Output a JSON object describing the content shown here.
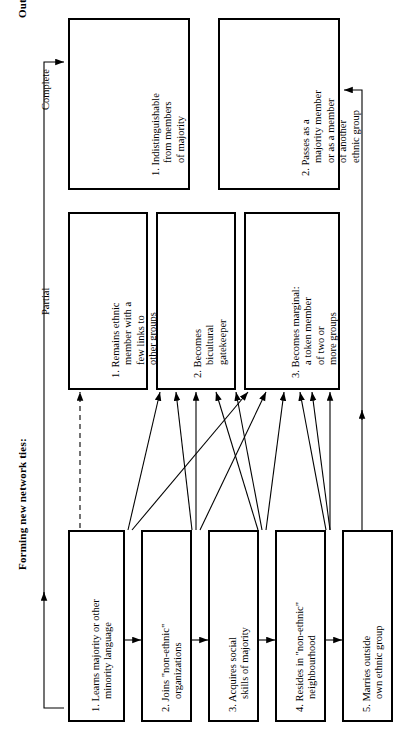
{
  "titles": {
    "outcome": "Outcome: Assimilation",
    "network": "Forming new network ties:"
  },
  "column_headers": {
    "complete": "Complete",
    "partial": "Partial"
  },
  "complete_outcomes": [
    {
      "num": "1.",
      "lines": [
        "Indistinguishable",
        "from members",
        "of majority"
      ]
    },
    {
      "num": "2.",
      "lines": [
        "Passes as a",
        "majority member",
        "or as a member",
        "of another",
        "ethnic group"
      ]
    }
  ],
  "partial_outcomes": [
    {
      "num": "1.",
      "lines": [
        "Remains ethnic",
        "member with a",
        "few links to",
        "other groups"
      ]
    },
    {
      "num": "2.",
      "lines": [
        "Becomes",
        "bicultural",
        "gatekeeper"
      ]
    },
    {
      "num": "3.",
      "lines": [
        "Becomes marginal:",
        "a token member",
        "of two or",
        "more groups"
      ]
    }
  ],
  "network_steps": [
    {
      "num": "1.",
      "lines": [
        "Learns majority or other",
        "minority language"
      ]
    },
    {
      "num": "2.",
      "lines": [
        "Joins \"non-ethnic\"",
        "organizations"
      ]
    },
    {
      "num": "3.",
      "lines": [
        "Acquires social",
        "skills of majority"
      ]
    },
    {
      "num": "4.",
      "lines": [
        "Resides in \"non-ethnic\"",
        "neighbourhood"
      ]
    },
    {
      "num": "5.",
      "lines": [
        "Marries outside",
        "own ethnic group"
      ]
    }
  ],
  "colors": {
    "stroke": "#000000",
    "background": "#ffffff"
  }
}
